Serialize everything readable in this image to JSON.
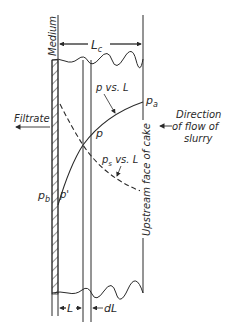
{
  "diagram": {
    "labels": {
      "medium": "Medium",
      "cake_thickness": "L",
      "cake_thickness_sub": "c",
      "p_vs_L": "p vs. L",
      "p_a": "p",
      "p_a_sub": "a",
      "filtrate": "Filtrate",
      "direction_line1": "Direction",
      "direction_line2": "of flow of",
      "direction_line3": "slurry",
      "p": "p",
      "ps_vs_L_p": "p",
      "ps_vs_L_sub": "s",
      "ps_vs_L_rest": " vs. L",
      "p_b": "p",
      "p_b_sub": "b",
      "p_prime": "p'",
      "upstream_face": "Upstream face of cake",
      "L": "L",
      "dL": "dL"
    },
    "colors": {
      "ink": "#2a2a2a",
      "background": "#ffffff"
    }
  }
}
